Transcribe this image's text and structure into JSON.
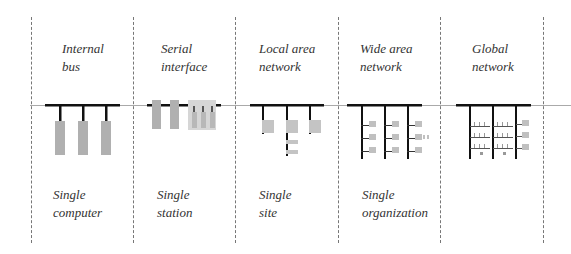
{
  "columns": [
    {
      "id": "internal-bus",
      "title_line1": "Internal",
      "title_line2": "bus",
      "scope_line1": "Single",
      "scope_line2": "computer"
    },
    {
      "id": "serial-interface",
      "title_line1": "Serial",
      "title_line2": "interface",
      "scope_line1": "Single",
      "scope_line2": "station"
    },
    {
      "id": "local-area-network",
      "title_line1": "Local area",
      "title_line2": "network",
      "scope_line1": "Single",
      "scope_line2": "site"
    },
    {
      "id": "wide-area-network",
      "title_line1": "Wide area",
      "title_line2": "network",
      "scope_line1": "Single",
      "scope_line2": "organization"
    },
    {
      "id": "global-network",
      "title_line1": "Global",
      "title_line2": "network",
      "scope_line1": "",
      "scope_line2": ""
    }
  ],
  "colors": {
    "bus": "#111111",
    "node": "#b0b0b0",
    "node_light": "#d0d0d0",
    "divider": "#777777",
    "text": "#333333"
  }
}
